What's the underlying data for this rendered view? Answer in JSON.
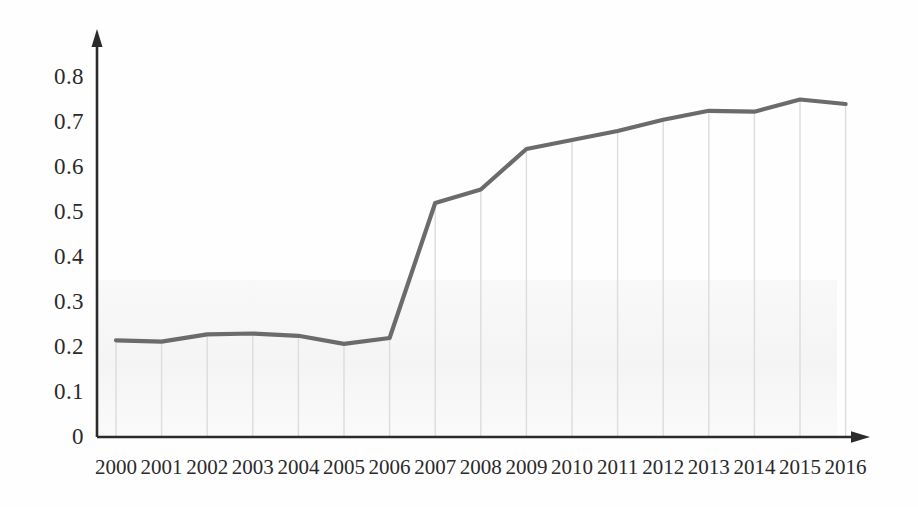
{
  "chart_data": {
    "type": "line",
    "title": "",
    "subtitle": "",
    "xlabel": "",
    "ylabel": "",
    "categories": [
      "2000",
      "2001",
      "2002",
      "2003",
      "2004",
      "2005",
      "2006",
      "2007",
      "2008",
      "2009",
      "2010",
      "2011",
      "2012",
      "2013",
      "2014",
      "2015",
      "2016"
    ],
    "values": [
      0.215,
      0.212,
      0.228,
      0.23,
      0.225,
      0.207,
      0.22,
      0.52,
      0.55,
      0.64,
      0.66,
      0.68,
      0.705,
      0.725,
      0.723,
      0.75,
      0.74
    ],
    "series": [
      {
        "name": "",
        "values": [
          0.215,
          0.212,
          0.228,
          0.23,
          0.225,
          0.207,
          0.22,
          0.52,
          0.55,
          0.64,
          0.66,
          0.68,
          0.705,
          0.725,
          0.723,
          0.75,
          0.74
        ]
      }
    ],
    "x": [
      "2000",
      "2001",
      "2002",
      "2003",
      "2004",
      "2005",
      "2006",
      "2007",
      "2008",
      "2009",
      "2010",
      "2011",
      "2012",
      "2013",
      "2014",
      "2015",
      "2016"
    ],
    "ylim": [
      0,
      0.85
    ],
    "yticks": [
      0,
      0.1,
      0.2,
      0.3,
      0.4,
      0.5,
      0.6,
      0.7,
      0.8
    ],
    "ytick_labels": [
      "0",
      "0.1",
      "0.2",
      "0.3",
      "0.4",
      "0.5",
      "0.6",
      "0.7",
      "0.8"
    ],
    "xtick_labels": [
      "2000",
      "2001",
      "2002",
      "2003",
      "2004",
      "2005",
      "2006",
      "2007",
      "2008",
      "2009",
      "2010",
      "2011",
      "2012",
      "2013",
      "2014",
      "2015",
      "2016"
    ],
    "grid": {
      "vertical": true,
      "horizontal": false,
      "color": "#dcdcdc"
    },
    "legend": {
      "visible": false,
      "position": "none",
      "entries": []
    },
    "annotations": [],
    "line_color": "#6b6b6b",
    "line_width": 4,
    "axis_color": "#2b2b2b",
    "axis_arrows": true,
    "markers": false
  },
  "axes": {
    "y_tick_labels": [
      "0.8",
      "0.7",
      "0.6",
      "0.5",
      "0.4",
      "0.3",
      "0.2",
      "0.1",
      "0"
    ],
    "x_tick_labels": [
      "2000",
      "2001",
      "2002",
      "2003",
      "2004",
      "2005",
      "2006",
      "2007",
      "2008",
      "2009",
      "2010",
      "2011",
      "2012",
      "2013",
      "2014",
      "2015",
      "2016"
    ]
  }
}
